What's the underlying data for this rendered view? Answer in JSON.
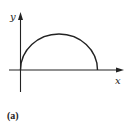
{
  "figure": {
    "panel_label": "(a)",
    "x_axis_label": "x",
    "y_axis_label": "y",
    "curve": {
      "shape": "semicircle-arc",
      "start": [
        0,
        0
      ],
      "end": [
        1,
        0
      ],
      "peak_height_ratio": 0.47
    },
    "colors": {
      "stroke": "#222222",
      "background": "#ffffff"
    }
  }
}
